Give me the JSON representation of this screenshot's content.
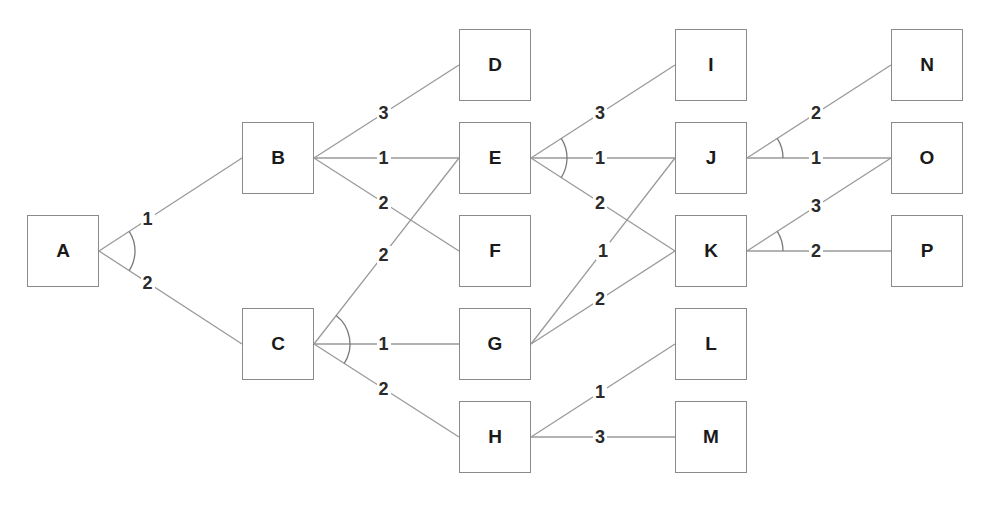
{
  "diagram": {
    "type": "and-or-tree",
    "node_size": 72,
    "colors": {
      "line": "#9a9a9a",
      "box_border": "#8a8a8a",
      "text": "#1a1a1a"
    },
    "nodes": [
      {
        "id": "A",
        "x": 27,
        "y": 215
      },
      {
        "id": "B",
        "x": 242,
        "y": 122
      },
      {
        "id": "C",
        "x": 242,
        "y": 308
      },
      {
        "id": "D",
        "x": 459,
        "y": 29
      },
      {
        "id": "E",
        "x": 459,
        "y": 122
      },
      {
        "id": "F",
        "x": 459,
        "y": 215
      },
      {
        "id": "G",
        "x": 459,
        "y": 308
      },
      {
        "id": "H",
        "x": 459,
        "y": 401
      },
      {
        "id": "I",
        "x": 675,
        "y": 29
      },
      {
        "id": "J",
        "x": 675,
        "y": 122
      },
      {
        "id": "K",
        "x": 675,
        "y": 215
      },
      {
        "id": "L",
        "x": 675,
        "y": 308
      },
      {
        "id": "M",
        "x": 675,
        "y": 401
      },
      {
        "id": "N",
        "x": 891,
        "y": 29
      },
      {
        "id": "O",
        "x": 891,
        "y": 122
      },
      {
        "id": "P",
        "x": 891,
        "y": 215
      }
    ],
    "edges": [
      {
        "from": "A",
        "to": "B",
        "cost": "1",
        "t": 0.34
      },
      {
        "from": "A",
        "to": "C",
        "cost": "2",
        "t": 0.34
      },
      {
        "from": "B",
        "to": "D",
        "cost": "3",
        "t": 0.48
      },
      {
        "from": "B",
        "to": "E",
        "cost": "1",
        "t": 0.48
      },
      {
        "from": "B",
        "to": "F",
        "cost": "2",
        "t": 0.48
      },
      {
        "from": "C",
        "to": "E",
        "cost": "2",
        "t": 0.48
      },
      {
        "from": "C",
        "to": "G",
        "cost": "1",
        "t": 0.48
      },
      {
        "from": "C",
        "to": "H",
        "cost": "2",
        "t": 0.48
      },
      {
        "from": "E",
        "to": "I",
        "cost": "3",
        "t": 0.48
      },
      {
        "from": "E",
        "to": "J",
        "cost": "1",
        "t": 0.48
      },
      {
        "from": "E",
        "to": "K",
        "cost": "2",
        "t": 0.48
      },
      {
        "from": "G",
        "to": "J",
        "cost": "1",
        "t": 0.5
      },
      {
        "from": "G",
        "to": "K",
        "cost": "2",
        "t": 0.48
      },
      {
        "from": "H",
        "to": "L",
        "cost": "1",
        "t": 0.48
      },
      {
        "from": "H",
        "to": "M",
        "cost": "3",
        "t": 0.48
      },
      {
        "from": "J",
        "to": "N",
        "cost": "2",
        "t": 0.48
      },
      {
        "from": "J",
        "to": "O",
        "cost": "1",
        "t": 0.48
      },
      {
        "from": "K",
        "to": "O",
        "cost": "3",
        "t": 0.48
      },
      {
        "from": "K",
        "to": "P",
        "cost": "2",
        "t": 0.48
      }
    ],
    "and_arcs": [
      {
        "at": "A",
        "edges": [
          [
            "A",
            "B"
          ],
          [
            "A",
            "C"
          ]
        ],
        "radius": 36
      },
      {
        "at": "C",
        "edges": [
          [
            "C",
            "E"
          ],
          [
            "C",
            "H"
          ]
        ],
        "radius": 36
      },
      {
        "at": "E",
        "edges": [
          [
            "E",
            "I"
          ],
          [
            "E",
            "K"
          ]
        ],
        "radius": 36
      },
      {
        "at": "J",
        "edges": [
          [
            "J",
            "N"
          ],
          [
            "J",
            "O"
          ]
        ],
        "radius": 36
      },
      {
        "at": "K",
        "edges": [
          [
            "K",
            "O"
          ],
          [
            "K",
            "P"
          ]
        ],
        "radius": 36
      }
    ]
  }
}
